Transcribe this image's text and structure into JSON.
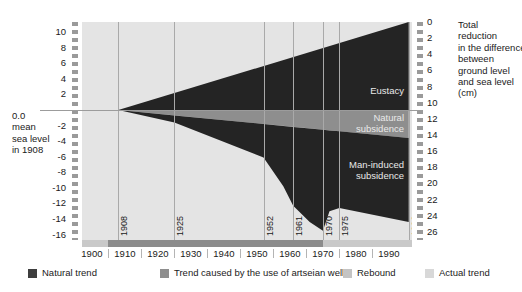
{
  "chart_data": {
    "type": "area",
    "title": "",
    "subtitle": "",
    "left_axis": {
      "label_lines": [
        "0.0",
        "mean",
        "sea level",
        "in 1908"
      ],
      "ticks": [
        10,
        8,
        6,
        4,
        2,
        -2,
        -4,
        -6,
        -8,
        -10,
        -12,
        -14,
        -16
      ],
      "zero_tick": "0.0",
      "range": [
        -16,
        11
      ],
      "unit": "cm"
    },
    "right_axis": {
      "label_lines": [
        "Total",
        "reduction",
        "in the difference",
        "between",
        "ground level",
        "and sea level",
        "(cm)"
      ],
      "ticks": [
        0,
        2,
        4,
        6,
        8,
        10,
        12,
        14,
        16,
        18,
        20,
        22,
        24,
        26
      ],
      "range": [
        0,
        27
      ],
      "unit": "cm"
    },
    "xaxis": {
      "ticks": [
        1900,
        1910,
        1920,
        1930,
        1940,
        1950,
        1960,
        1970,
        1980,
        1990
      ],
      "range": [
        1897,
        1997
      ],
      "inner_markers": [
        1908,
        1925,
        1952,
        1961,
        1970,
        1975,
        1996
      ]
    },
    "grid": "vertical gridlines at inner markers",
    "legend_position": "bottom",
    "series": [
      {
        "name": "Eustacy",
        "color": "#242424",
        "description": "Upper black wedge above 0.0 sea level line, grows linearly from 1908 to 1996",
        "points": [
          {
            "year": 1908,
            "value": 0.0
          },
          {
            "year": 1996,
            "value": 11.3
          }
        ]
      },
      {
        "name": "Natural subsidence",
        "color": "#8e8e8e",
        "description": "Grey band immediately below the 0.0 line, widening linearly",
        "points": [
          {
            "year": 1908,
            "value": 0.0
          },
          {
            "year": 1996,
            "value": -3.6
          }
        ]
      },
      {
        "name": "Man-induced subsidence",
        "color": "#242424",
        "description": "Lower black region between natural subsidence band and actual ground level curve",
        "lower_boundary_points": [
          {
            "year": 1908,
            "value": 0.0
          },
          {
            "year": 1925,
            "value": -1.6
          },
          {
            "year": 1952,
            "value": -6.1
          },
          {
            "year": 1958,
            "value": -9.8
          },
          {
            "year": 1961,
            "value": -12.3
          },
          {
            "year": 1966,
            "value": -14.4
          },
          {
            "year": 1970,
            "value": -15.5
          },
          {
            "year": 1972,
            "value": -13.0
          },
          {
            "year": 1975,
            "value": -12.6
          },
          {
            "year": 1996,
            "value": -14.4
          }
        ]
      }
    ],
    "area_labels": [
      {
        "text": "Eustacy",
        "lines": [
          "Eustacy"
        ]
      },
      {
        "text": "Natural subsidence",
        "lines": [
          "Natural",
          "subsidence"
        ]
      },
      {
        "text": "Man-induced subsidence",
        "lines": [
          "Man-induced",
          "subsidence"
        ]
      }
    ],
    "legend": [
      {
        "label": "Natural trend",
        "color": "#3e3e3e"
      },
      {
        "label": "Trend caused by the use of artseian wells",
        "color": "#8e8e8e"
      },
      {
        "label": "Rebound",
        "color": "#c4c4c4"
      },
      {
        "label": "Actual trend",
        "color": "#d8d8d8"
      }
    ],
    "colors": {
      "panel_background": "#e4e4e4",
      "dark_fill": "#242424",
      "mid_gray": "#8e8e8e",
      "gridline": "#a9a9a9",
      "axis_rail": "#9a9a9a",
      "xband_light": "#c9c9c9",
      "xband_dark": "#8c8c8c",
      "page_background": "#ffffff"
    }
  }
}
